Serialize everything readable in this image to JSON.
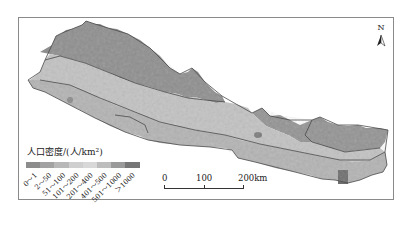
{
  "map": {
    "subject": "Population density map (Nepal)",
    "north_arrow": {
      "label": "N",
      "icon": "north-arrow-icon"
    },
    "legend": {
      "title": "人口密度/(人/km²)",
      "classes": [
        {
          "label": "0～1",
          "color": "#8c8c8c"
        },
        {
          "label": "2～50",
          "color": "#a2a2a2"
        },
        {
          "label": "51～100",
          "color": "#b8b8b8"
        },
        {
          "label": "101～200",
          "color": "#cfcfcf"
        },
        {
          "label": "201～400",
          "color": "#d8d8d8"
        },
        {
          "label": "401～500",
          "color": "#bdbdbd"
        },
        {
          "label": "501～1000",
          "color": "#9a9a9a"
        },
        {
          "label": "＞1000",
          "color": "#767676"
        }
      ]
    },
    "scale_bar": {
      "labels": [
        "0",
        "100",
        "200km"
      ]
    }
  }
}
